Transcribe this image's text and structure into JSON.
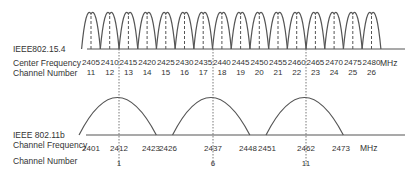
{
  "top": {
    "label": "IEEE802.15.4",
    "row1_label": "Center Frequency",
    "row2_label": "Channel Number",
    "unit": "MHz",
    "frequencies": [
      "2405",
      "2410",
      "2415",
      "2420",
      "2425",
      "2430",
      "2435",
      "2440",
      "2445",
      "2450",
      "2455",
      "2460",
      "2465",
      "2470",
      "2475",
      "2480"
    ],
    "channels": [
      "11",
      "12",
      "13",
      "14",
      "15",
      "16",
      "17",
      "18",
      "19",
      "20",
      "21",
      "22",
      "23",
      "24",
      "25",
      "26"
    ]
  },
  "bottom": {
    "label": "IEEE 802.11b",
    "row1_label": "Channel Frequency",
    "row2_label": "Channel Number",
    "unit": "MHz",
    "frequencies": [
      "2401",
      "2412",
      "2423",
      "2426",
      "2437",
      "2448",
      "2451",
      "2462",
      "2473"
    ],
    "channels": [
      "1",
      "6",
      "11"
    ]
  },
  "colors": {
    "line": "#555555",
    "text": "#333333",
    "background": "#ffffff"
  }
}
